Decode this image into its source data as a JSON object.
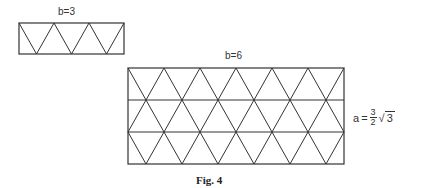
{
  "figure": {
    "caption": "Fig. 4",
    "small_grid": {
      "label": "b=3",
      "b": 3,
      "rows": 1,
      "rect": {
        "x": 19,
        "y": 23,
        "w": 105,
        "h": 31
      }
    },
    "large_grid": {
      "label": "b=6",
      "b": 6,
      "rows": 3,
      "rect": {
        "x": 128,
        "y": 68,
        "w": 216,
        "h": 96
      }
    },
    "formula": {
      "lhs": "a",
      "eq": "=",
      "numerator": "3",
      "denominator": "2",
      "sqrt_symbol": "√",
      "radicand": "3"
    },
    "line_color": "#333333"
  }
}
